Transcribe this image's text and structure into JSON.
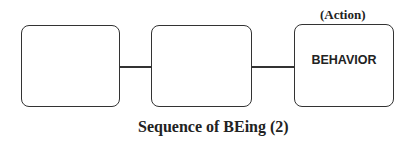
{
  "diagram": {
    "title": "Sequence of BEing (2)",
    "boxes": [
      {
        "id": "box-1",
        "label": "",
        "annotation": ""
      },
      {
        "id": "box-2",
        "label": "",
        "annotation": ""
      },
      {
        "id": "box-3",
        "label": "BEHAVIOR",
        "annotation": "(Action)"
      }
    ],
    "connectors": [
      {
        "from": "box-1",
        "to": "box-2"
      },
      {
        "from": "box-2",
        "to": "box-3"
      }
    ],
    "colors": {
      "stroke": "#333333",
      "text": "#222222",
      "background": "#ffffff"
    }
  }
}
